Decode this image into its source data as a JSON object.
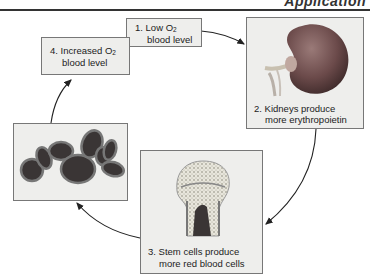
{
  "header": {
    "text": "Application"
  },
  "steps": [
    {
      "number": "1.",
      "line1_prefix": "Low O",
      "line1_sub": "2",
      "line2": "blood level"
    },
    {
      "number": "2.",
      "line1": "Kidneys produce",
      "line2": "more erythropoietin",
      "image": "kidney-illustration"
    },
    {
      "number": "3.",
      "line1": "Stem cells produce",
      "line2": "more red blood cells",
      "image": "bone-marrow-illustration"
    },
    {
      "number": "4.",
      "line1_prefix": "Increased O",
      "line1_sub": "2",
      "line2": "blood level"
    }
  ],
  "rbc_box": {
    "image": "red-blood-cells-illustration"
  },
  "colors": {
    "box_bg": "#eeeeec",
    "border": "#777777",
    "kidney": "#6b4a4a",
    "rbc": "#3a3535"
  }
}
